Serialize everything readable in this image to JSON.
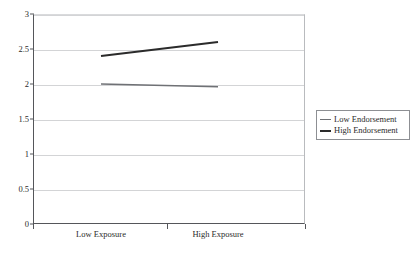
{
  "chart_data": {
    "type": "line",
    "title": "",
    "subtitle": "",
    "xlabel": "",
    "ylabel": "",
    "categories": [
      "Low Exposure",
      "High Exposure"
    ],
    "ylim": [
      0,
      3
    ],
    "yticks": [
      "0",
      "0.5",
      "1",
      "1.5",
      "2",
      "2.5",
      "3"
    ],
    "ytick_values": [
      0,
      0.5,
      1,
      1.5,
      2,
      2.5,
      3
    ],
    "grid": "horizontal",
    "legend_position": "right",
    "series": [
      {
        "name": "Low Endorsement",
        "values": [
          2.0,
          1.96
        ],
        "color": "#6f7175",
        "width": 1.4
      },
      {
        "name": "High Endorsement",
        "values": [
          2.4,
          2.6
        ],
        "color": "#2b2b2b",
        "width": 2.2
      }
    ]
  },
  "legend": {
    "items": [
      {
        "label": "Low Endorsement"
      },
      {
        "label": "High Endorsement"
      }
    ]
  },
  "axes": {
    "x_labels": [
      "Low Exposure",
      "High Exposure"
    ],
    "y_labels": [
      "3",
      "2.5",
      "2",
      "1.5",
      "1",
      "0.5",
      "0"
    ]
  },
  "colors": {
    "background": "#ffffff",
    "axis": "#55565a",
    "gridline": "#d3d4d6",
    "series_low": "#6f7175",
    "series_high": "#2b2b2b",
    "text": "#2b2b2b",
    "legend_border": "#8d8f93"
  }
}
